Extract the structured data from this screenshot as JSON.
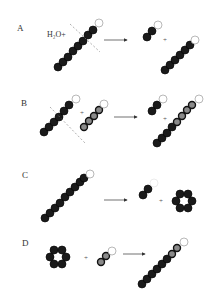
{
  "panels": [
    {
      "label": "A",
      "reagent": "H₂O+",
      "description": "Hydrolysis: chain cleaved by water into a short dimer (with terminal unit) and a longer chain"
    },
    {
      "label": "B",
      "reagent": "+",
      "description": "Transfer: chain cleaved and fragment transferred onto a second (gray) chain"
    },
    {
      "label": "C",
      "reagent": "",
      "description": "Cyclization: chain releases dimer and a cyclic ring of 6 units"
    },
    {
      "label": "D",
      "reagent": "",
      "description": "Coupling: cyclic ring plus short chain yields long chain"
    }
  ],
  "symbols": {
    "plus": "+",
    "arrow": "→"
  },
  "colors": {
    "bead_dark": "#1a1a1a",
    "bead_gray_center": "#8a8a8a",
    "terminal_bead": "#ffffff",
    "cut_line": "#777777",
    "text": "#333333"
  }
}
